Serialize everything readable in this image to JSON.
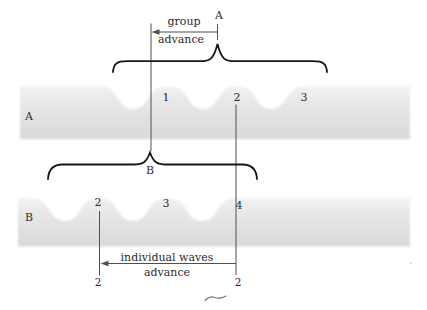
{
  "group_marker": {
    "label": "A"
  },
  "group_arrow": {
    "line1": "group",
    "line2": "advance"
  },
  "band_a": {
    "label": "A",
    "crest_labels": [
      "1",
      "2",
      "3"
    ]
  },
  "group_b_brace": {
    "label": "B"
  },
  "band_b": {
    "label": "B",
    "crest_labels": [
      "2",
      "3",
      "4"
    ]
  },
  "individual_arrow": {
    "line1": "individual waves",
    "line2": "advance",
    "left_label": "2",
    "right_label": "2"
  },
  "colors": {
    "background": "#ffffff",
    "band_fill_dark": "#d9d9d9",
    "band_fill_light": "#f3f3f3",
    "brace": "#161616",
    "line": "#4f4f4f",
    "text": "#2b2b2b"
  }
}
